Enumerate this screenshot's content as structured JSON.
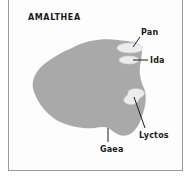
{
  "figure": {
    "title": "AMALTHEA",
    "body_color": "#a9a9a9",
    "crater_color": "#ececec",
    "frame_color": "#9a9a9a",
    "labels": [
      {
        "id": "pan",
        "text": "Pan"
      },
      {
        "id": "ida",
        "text": "Ida"
      },
      {
        "id": "lyctos",
        "text": "Lyctos"
      },
      {
        "id": "gaea",
        "text": "Gaea"
      }
    ]
  }
}
